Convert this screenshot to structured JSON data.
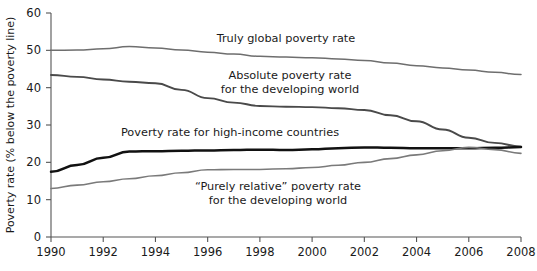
{
  "chart_data": {
    "type": "line",
    "title": "",
    "xlabel": "",
    "ylabel": "Poverty rate (% below the poverty line)",
    "xlim": [
      1990,
      2008
    ],
    "ylim": [
      0,
      60
    ],
    "grid": false,
    "legend_position": "inline-annotations",
    "x_ticks": [
      "1990",
      "1992",
      "1994",
      "1996",
      "1998",
      "2000",
      "2002",
      "2004",
      "2006",
      "2008"
    ],
    "y_ticks": [
      "0",
      "10",
      "20",
      "30",
      "40",
      "50",
      "60"
    ],
    "x": [
      1990,
      1991,
      1992,
      1993,
      1994,
      1995,
      1996,
      1997,
      1998,
      1999,
      2000,
      2001,
      2002,
      2003,
      2004,
      2005,
      2006,
      2007,
      2008
    ],
    "series": [
      {
        "name": "Truly global poverty rate",
        "color": "#6e6e6e",
        "width": 1.5,
        "values": [
          50.0,
          50.1,
          50.4,
          51.0,
          50.6,
          50.1,
          49.5,
          49.0,
          48.4,
          48.2,
          48.0,
          47.7,
          47.3,
          46.6,
          45.9,
          45.3,
          44.7,
          44.1,
          43.5
        ]
      },
      {
        "name": "Absolute poverty rate for the developing world",
        "color": "#4a4a4a",
        "width": 1.9,
        "values": [
          43.4,
          42.9,
          42.2,
          41.6,
          41.2,
          39.4,
          37.2,
          36.0,
          35.1,
          34.9,
          34.8,
          34.5,
          34.0,
          32.6,
          31.0,
          28.8,
          26.6,
          25.2,
          24.2
        ]
      },
      {
        "name": "Poverty rate for high-income countries",
        "color": "#111111",
        "width": 2.5,
        "values": [
          17.5,
          19.3,
          21.2,
          22.9,
          23.0,
          23.1,
          23.2,
          23.3,
          23.4,
          23.3,
          23.5,
          23.8,
          24.0,
          23.9,
          23.8,
          23.8,
          23.8,
          23.9,
          24.1
        ]
      },
      {
        "name": "“Purely relative” poverty rate for the developing world",
        "color": "#7a7a7a",
        "width": 1.6,
        "values": [
          13.0,
          13.9,
          14.8,
          15.6,
          16.4,
          17.2,
          18.0,
          18.1,
          18.1,
          18.3,
          18.6,
          19.2,
          20.0,
          21.0,
          22.0,
          23.1,
          24.0,
          23.4,
          22.4
        ]
      }
    ],
    "annotations": [
      {
        "key": "truly_global",
        "text": "Truly global poverty rate",
        "x": 286,
        "y": 42,
        "anchor": "middle",
        "lines": [
          "Truly global poverty rate"
        ]
      },
      {
        "key": "absolute",
        "text": "Absolute poverty rate for the developing world",
        "x": 290,
        "y": 79,
        "anchor": "middle",
        "lines": [
          "Absolute poverty rate",
          "for the developing world"
        ]
      },
      {
        "key": "high_income",
        "text": "Poverty rate for high-income countries",
        "x": 230,
        "y": 136,
        "anchor": "middle",
        "lines": [
          "Poverty rate for high-income countries"
        ]
      },
      {
        "key": "purely_relative",
        "text": "“Purely relative” poverty rate for the developing world",
        "x": 278,
        "y": 190,
        "anchor": "middle",
        "lines": [
          "“Purely relative” poverty rate",
          "for the developing world"
        ]
      }
    ]
  }
}
